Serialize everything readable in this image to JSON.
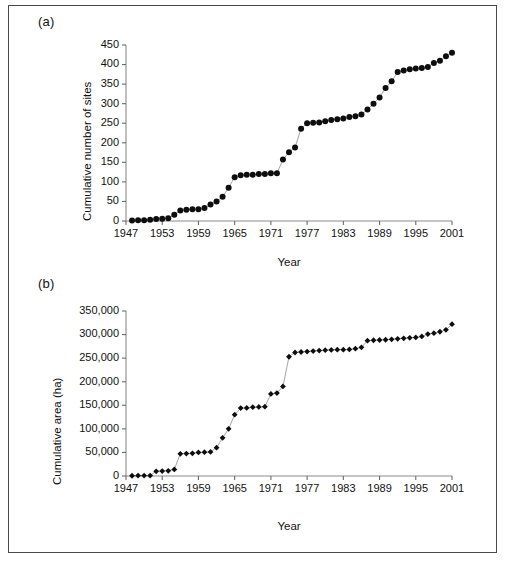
{
  "figure": {
    "panels": [
      {
        "id": "a",
        "label": "(a)",
        "chart_data": {
          "type": "line",
          "title": "",
          "subtitle": "",
          "xlabel": "Year",
          "ylabel": "Cumulative number of sites",
          "xlim": [
            1947,
            2001
          ],
          "ylim": [
            0,
            450
          ],
          "xticks": [
            1947,
            1953,
            1959,
            1965,
            1971,
            1977,
            1983,
            1989,
            1995,
            2001
          ],
          "yticks": [
            0,
            50,
            100,
            150,
            200,
            250,
            300,
            350,
            400,
            450
          ],
          "xtick_labels": [
            "1947",
            "1953",
            "1959",
            "1965",
            "1971",
            "1977",
            "1983",
            "1989",
            "1995",
            "2001"
          ],
          "ytick_labels": [
            "0",
            "50",
            "100",
            "150",
            "200",
            "250",
            "300",
            "350",
            "400",
            "450"
          ],
          "grid": false,
          "legend": "none",
          "marker": "circle",
          "series": [
            {
              "name": "Cumulative number of sites",
              "x": [
                1948,
                1949,
                1950,
                1951,
                1952,
                1953,
                1954,
                1955,
                1956,
                1957,
                1958,
                1959,
                1960,
                1961,
                1962,
                1963,
                1964,
                1965,
                1966,
                1967,
                1968,
                1969,
                1970,
                1971,
                1972,
                1973,
                1974,
                1975,
                1976,
                1977,
                1978,
                1979,
                1980,
                1981,
                1982,
                1983,
                1984,
                1985,
                1986,
                1987,
                1988,
                1989,
                1990,
                1991,
                1992,
                1993,
                1994,
                1995,
                1996,
                1997,
                1998,
                1999,
                2000,
                2001
              ],
              "values": [
                1,
                2,
                2,
                3,
                5,
                6,
                7,
                16,
                27,
                29,
                30,
                30,
                33,
                42,
                50,
                62,
                85,
                112,
                117,
                118,
                118,
                120,
                120,
                122,
                122,
                157,
                176,
                188,
                236,
                250,
                251,
                252,
                255,
                258,
                260,
                262,
                266,
                268,
                272,
                285,
                300,
                316,
                340,
                357,
                381,
                385,
                388,
                390,
                391,
                394,
                404,
                410,
                421,
                430
              ]
            }
          ]
        }
      },
      {
        "id": "b",
        "label": "(b)",
        "chart_data": {
          "type": "line",
          "title": "",
          "subtitle": "",
          "xlabel": "Year",
          "ylabel": "Cumulative area (ha)",
          "xlim": [
            1947,
            2001
          ],
          "ylim": [
            0,
            350000
          ],
          "xticks": [
            1947,
            1953,
            1959,
            1965,
            1971,
            1977,
            1983,
            1989,
            1995,
            2001
          ],
          "yticks": [
            0,
            50000,
            100000,
            150000,
            200000,
            250000,
            300000,
            350000
          ],
          "xtick_labels": [
            "1947",
            "1953",
            "1959",
            "1965",
            "1971",
            "1977",
            "1983",
            "1989",
            "1995",
            "2001"
          ],
          "ytick_labels": [
            "0",
            "50,000",
            "100,000",
            "150,000",
            "200,000",
            "250,000",
            "300,000",
            "350,000"
          ],
          "grid": false,
          "legend": "none",
          "marker": "diamond",
          "series": [
            {
              "name": "Cumulative area (ha)",
              "x": [
                1948,
                1949,
                1950,
                1951,
                1952,
                1953,
                1954,
                1955,
                1956,
                1957,
                1958,
                1959,
                1960,
                1961,
                1962,
                1963,
                1964,
                1965,
                1966,
                1967,
                1968,
                1969,
                1970,
                1971,
                1972,
                1973,
                1974,
                1975,
                1976,
                1977,
                1978,
                1979,
                1980,
                1981,
                1982,
                1983,
                1984,
                1985,
                1986,
                1987,
                1988,
                1989,
                1990,
                1991,
                1992,
                1993,
                1994,
                1995,
                1996,
                1997,
                1998,
                1999,
                2000,
                2001
              ],
              "values": [
                500,
                800,
                900,
                1000,
                10000,
                10500,
                11000,
                14000,
                47000,
                47500,
                48000,
                50000,
                50500,
                51000,
                60000,
                81000,
                100000,
                130000,
                144000,
                144500,
                146000,
                146500,
                147000,
                174000,
                176000,
                190000,
                253000,
                262000,
                263000,
                264000,
                265000,
                266000,
                267000,
                267500,
                268000,
                268000,
                268500,
                270000,
                273000,
                287000,
                288000,
                288500,
                289000,
                290000,
                291000,
                292000,
                293000,
                294000,
                296000,
                301000,
                303000,
                306000,
                310000,
                322000
              ]
            }
          ]
        }
      }
    ]
  }
}
